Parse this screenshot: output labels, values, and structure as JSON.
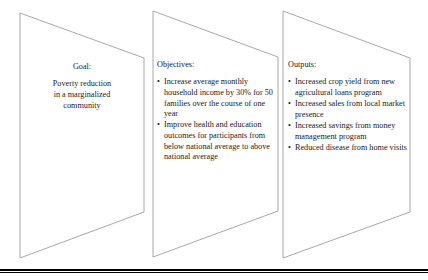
{
  "figure": {
    "type": "three-panel-chevron-diagram",
    "shape_outline_color": "#a6a6a6",
    "shape_fill_color": "#ffffff",
    "text_color": "#1a1a1a",
    "rule_color": "#000000"
  },
  "panels": [
    {
      "id": "goal",
      "heading": "Goal:",
      "body": "Poverty reduction in a marginalized community",
      "body_lines": [
        "Poverty reduction",
        "in a marginalized",
        "community"
      ],
      "bullets": []
    },
    {
      "id": "objectives",
      "heading": "Objectives:",
      "body": "",
      "body_lines": [],
      "bullets": [
        "Increase average monthly household income by 30% for 50 families over the course of one year",
        "Improve health and education outcomes for participants from below national average to above national average"
      ]
    },
    {
      "id": "outputs",
      "heading": "Outputs:",
      "body": "",
      "body_lines": [],
      "bullets": [
        "Increased crop yield from new agricultural loans program",
        "Increased sales from local market presence",
        "Increased savings from money management program",
        "Reduced disease from home visits"
      ]
    }
  ],
  "bullet_glyph": "•"
}
